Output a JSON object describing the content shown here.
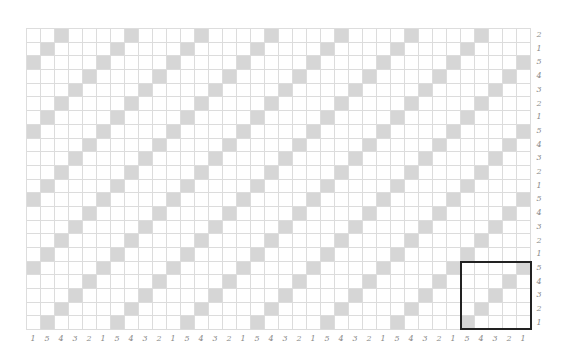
{
  "draft": {
    "columns": 36,
    "rows": 22,
    "cell_w": 14,
    "cell_h": 13.7,
    "shade_color": "#d6d6d6",
    "grid_color": "#dcdcdc",
    "row_labels_top_to_bottom": [
      "2",
      "1",
      "5",
      "4",
      "3",
      "2",
      "1",
      "5",
      "4",
      "3",
      "2",
      "1",
      "5",
      "4",
      "3",
      "2",
      "1",
      "5",
      "4",
      "3",
      "2",
      "1"
    ],
    "column_labels_left_to_right": [
      "1",
      "5",
      "4",
      "3",
      "2",
      "1",
      "5",
      "4",
      "3",
      "2",
      "1",
      "5",
      "4",
      "3",
      "2",
      "1",
      "5",
      "4",
      "3",
      "2",
      "1",
      "5",
      "4",
      "3",
      "2",
      "1",
      "5",
      "4",
      "3",
      "2",
      "1",
      "5",
      "4",
      "3",
      "2",
      "1"
    ],
    "highlight_box": {
      "col_start": 31,
      "col_count": 5,
      "row_start": 17,
      "row_count": 5,
      "color": "#222222"
    }
  }
}
